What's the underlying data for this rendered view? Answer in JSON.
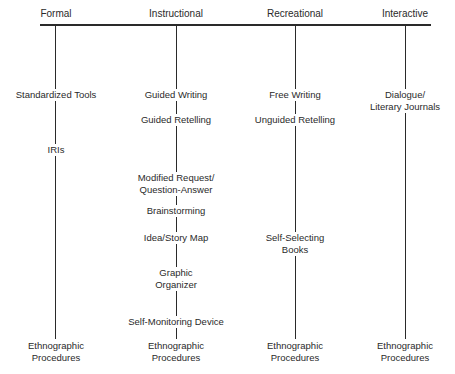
{
  "diagram": {
    "type": "tree",
    "columns": [
      {
        "id": "formal",
        "heading": "Formal",
        "nodes": [
          {
            "line1": "Standardized Tools",
            "line2": ""
          },
          {
            "line1": "IRIs",
            "line2": ""
          },
          {
            "line1": "Ethnographic",
            "line2": "Procedures"
          }
        ]
      },
      {
        "id": "instructional",
        "heading": "Instructional",
        "nodes": [
          {
            "line1": "Guided Writing",
            "line2": ""
          },
          {
            "line1": "Guided Retelling",
            "line2": ""
          },
          {
            "line1": "Modified Request/",
            "line2": "Question-Answer"
          },
          {
            "line1": "Brainstorming",
            "line2": ""
          },
          {
            "line1": "Idea/Story Map",
            "line2": ""
          },
          {
            "line1": "Graphic",
            "line2": "Organizer"
          },
          {
            "line1": "Self-Monitoring Device",
            "line2": ""
          },
          {
            "line1": "Ethnographic",
            "line2": "Procedures"
          }
        ]
      },
      {
        "id": "recreational",
        "heading": "Recreational",
        "nodes": [
          {
            "line1": "Free Writing",
            "line2": ""
          },
          {
            "line1": "Unguided Retelling",
            "line2": ""
          },
          {
            "line1": "Self-Selecting",
            "line2": "Books"
          },
          {
            "line1": "Ethnographic",
            "line2": "Procedures"
          }
        ]
      },
      {
        "id": "interactive",
        "heading": "Interactive",
        "nodes": [
          {
            "line1": "Dialogue/",
            "line2": "Literary Journals"
          },
          {
            "line1": "Ethnographic",
            "line2": "Procedures"
          }
        ]
      }
    ],
    "colors": {
      "line": "#2a2a2a",
      "text": "#2a2a2a",
      "background": "#ffffff"
    }
  }
}
